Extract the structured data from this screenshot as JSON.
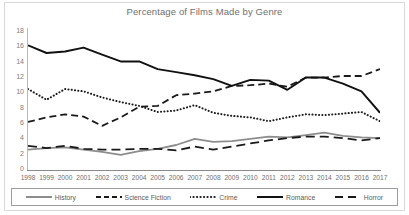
{
  "chart_data": {
    "type": "line",
    "title": "Percentage of Films Made by Genre",
    "xlabel": "",
    "ylabel": "",
    "ylim": [
      0,
      18
    ],
    "y_ticks": [
      0,
      2,
      4,
      6,
      8,
      10,
      12,
      14,
      16,
      18
    ],
    "grid": false,
    "legend_position": "bottom",
    "categories": [
      "1998",
      "1999",
      "2000",
      "2001",
      "2002",
      "2003",
      "2004",
      "2005",
      "2006",
      "2007",
      "2008",
      "2009",
      "2010",
      "2011",
      "2012",
      "2013",
      "2014",
      "2015",
      "2016",
      "2017"
    ],
    "series": [
      {
        "name": "History",
        "style": "solid",
        "color": "#8d8d8d",
        "values": [
          2.4,
          2.6,
          2.7,
          2.4,
          2.1,
          1.7,
          2.2,
          2.5,
          3.0,
          3.8,
          3.4,
          3.5,
          3.8,
          4.1,
          4.0,
          4.3,
          4.6,
          4.2,
          4.0,
          3.9
        ]
      },
      {
        "name": "Science Fiction",
        "style": "dashed",
        "color": "#1a1a1a",
        "values": [
          6.0,
          6.6,
          7.0,
          6.7,
          5.5,
          6.6,
          8.0,
          8.1,
          9.5,
          9.7,
          10.0,
          10.7,
          10.8,
          11.0,
          10.6,
          11.8,
          11.8,
          12.0,
          12.0,
          12.9
        ]
      },
      {
        "name": "Crime",
        "style": "dotted",
        "color": "#1a1a1a",
        "values": [
          10.3,
          8.9,
          10.3,
          10.0,
          9.2,
          8.6,
          8.1,
          7.3,
          7.5,
          8.2,
          7.2,
          6.8,
          6.6,
          6.1,
          6.6,
          7.0,
          6.9,
          7.1,
          7.3,
          6.1
        ]
      },
      {
        "name": "Romance",
        "style": "solid",
        "color": "#111111",
        "values": [
          16.0,
          15.0,
          15.2,
          15.7,
          14.8,
          13.9,
          13.9,
          12.9,
          12.5,
          12.1,
          11.6,
          10.7,
          11.5,
          11.4,
          10.2,
          11.8,
          11.8,
          11.0,
          10.0,
          7.2
        ]
      },
      {
        "name": "Horror",
        "style": "long-dash",
        "color": "#1a1a1a",
        "values": [
          2.9,
          2.6,
          2.9,
          2.5,
          2.4,
          2.4,
          2.5,
          2.5,
          2.3,
          2.8,
          2.4,
          2.8,
          3.2,
          3.6,
          3.9,
          4.1,
          4.1,
          3.9,
          3.6,
          3.9
        ]
      }
    ]
  },
  "legend": {
    "items": [
      {
        "label": "History"
      },
      {
        "label": "Science Fiction"
      },
      {
        "label": "Crime"
      },
      {
        "label": "Romance"
      },
      {
        "label": "Horror"
      }
    ]
  }
}
